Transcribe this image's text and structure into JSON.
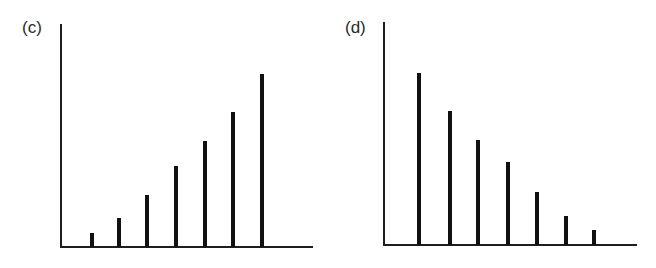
{
  "chart_data": [
    {
      "type": "bar",
      "title": "(c)",
      "categories": [
        "1",
        "2",
        "3",
        "4",
        "5",
        "6",
        "7"
      ],
      "values": [
        8,
        17,
        30,
        47,
        61,
        78,
        100
      ],
      "xlabel": "",
      "ylabel": "",
      "ylim": [
        0,
        115
      ],
      "grid": false,
      "legend": null,
      "tick_labels": false,
      "notes": "Spike/stick plot with increasing heights, unlabeled axes"
    },
    {
      "type": "bar",
      "title": "(d)",
      "categories": [
        "1",
        "2",
        "3",
        "4",
        "5",
        "6",
        "7"
      ],
      "values": [
        100,
        78,
        61,
        48,
        31,
        17,
        9
      ],
      "xlabel": "",
      "ylabel": "",
      "ylim": [
        0,
        115
      ],
      "grid": false,
      "legend": null,
      "tick_labels": false,
      "notes": "Spike/stick plot with decreasing heights, unlabeled axes"
    }
  ],
  "panels": {
    "left": {
      "label": "(c)"
    },
    "right": {
      "label": "(d)"
    }
  },
  "colors": {
    "bar": "#111111",
    "axis": "#1e1e1e",
    "background": "#ffffff"
  }
}
